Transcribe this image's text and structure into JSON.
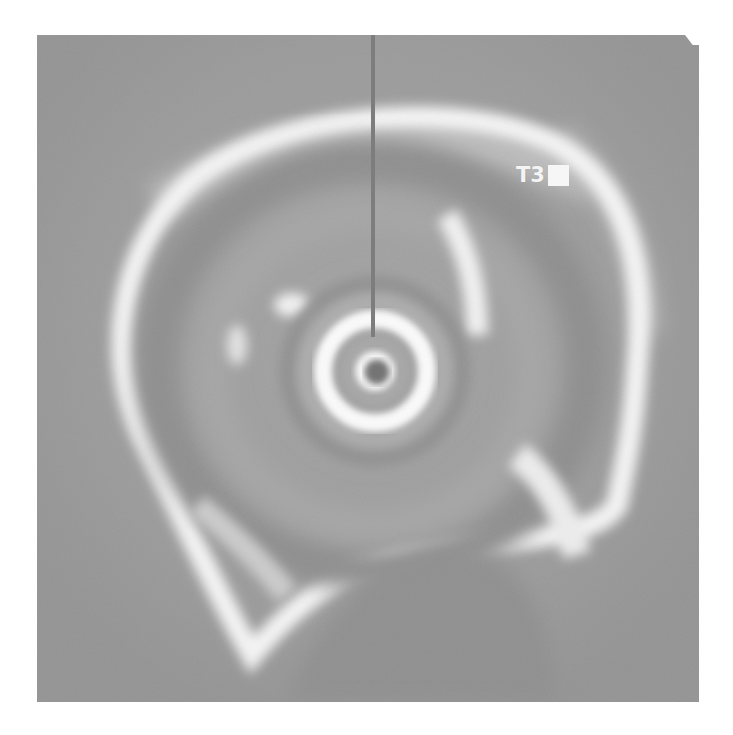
{
  "image": {
    "type": "endoscopic-ultrasound",
    "mode": "radial",
    "colors": {
      "background_page": "#ffffff",
      "tissue_gray": "#7d7d7d",
      "echo_bright": "#f5f5f5",
      "probe_dark": "#4a4a4a",
      "marker_line": "#555555"
    }
  },
  "overlay": {
    "label_text": "T3",
    "label_block": "filled-rectangle"
  }
}
